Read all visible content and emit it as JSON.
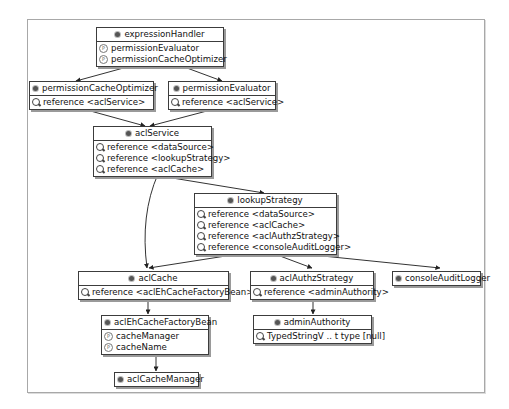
{
  "diagram": {
    "type": "spring-bean-dependency-graph",
    "nodes": {
      "expressionHandler": {
        "title": "expressionHandler",
        "rows": [
          {
            "kind": "property",
            "label": "permissionEvaluator"
          },
          {
            "kind": "property",
            "label": "permissionCacheOptimizer"
          }
        ]
      },
      "permissionCacheOptimizer": {
        "title": "permissionCacheOptimizer",
        "rows": [
          {
            "kind": "reference",
            "label": "reference <aclService>"
          }
        ]
      },
      "permissionEvaluator": {
        "title": "permissionEvaluator",
        "rows": [
          {
            "kind": "reference",
            "label": "reference <aclService>"
          }
        ]
      },
      "aclService": {
        "title": "aclService",
        "rows": [
          {
            "kind": "reference",
            "label": "reference <dataSource>"
          },
          {
            "kind": "reference",
            "label": "reference <lookupStrategy>"
          },
          {
            "kind": "reference",
            "label": "reference <aclCache>"
          }
        ]
      },
      "lookupStrategy": {
        "title": "lookupStrategy",
        "rows": [
          {
            "kind": "reference",
            "label": "reference <dataSource>"
          },
          {
            "kind": "reference",
            "label": "reference <aclCache>"
          },
          {
            "kind": "reference",
            "label": "reference <aclAuthzStrategy>"
          },
          {
            "kind": "reference",
            "label": "reference <consoleAuditLogger>"
          }
        ]
      },
      "aclCache": {
        "title": "aclCache",
        "rows": [
          {
            "kind": "reference",
            "label": "reference <aclEhCacheFactoryBean>"
          }
        ]
      },
      "aclAuthzStrategy": {
        "title": "aclAuthzStrategy",
        "rows": [
          {
            "kind": "reference",
            "label": "reference <adminAuthority>"
          }
        ]
      },
      "consoleAuditLogger": {
        "title": "consoleAuditLogger",
        "rows": []
      },
      "aclEhCacheFactoryBean": {
        "title": "aclEhCacheFactoryBean",
        "rows": [
          {
            "kind": "property",
            "label": "cacheManager"
          },
          {
            "kind": "property",
            "label": "cacheName"
          }
        ]
      },
      "adminAuthority": {
        "title": "adminAuthority",
        "rows": [
          {
            "kind": "reference",
            "label": "TypedStringV .. t type [null]"
          }
        ]
      },
      "aclCacheManager": {
        "title": "aclCacheManager",
        "rows": []
      }
    },
    "edges": [
      {
        "from": "expressionHandler",
        "to": "permissionCacheOptimizer"
      },
      {
        "from": "expressionHandler",
        "to": "permissionEvaluator"
      },
      {
        "from": "permissionCacheOptimizer",
        "to": "aclService"
      },
      {
        "from": "permissionEvaluator",
        "to": "aclService"
      },
      {
        "from": "aclService",
        "to": "lookupStrategy"
      },
      {
        "from": "aclService",
        "to": "aclCache"
      },
      {
        "from": "lookupStrategy",
        "to": "aclCache"
      },
      {
        "from": "lookupStrategy",
        "to": "aclAuthzStrategy"
      },
      {
        "from": "lookupStrategy",
        "to": "consoleAuditLogger"
      },
      {
        "from": "aclCache",
        "to": "aclEhCacheFactoryBean"
      },
      {
        "from": "aclAuthzStrategy",
        "to": "adminAuthority"
      },
      {
        "from": "aclEhCacheFactoryBean",
        "to": "aclCacheManager"
      }
    ]
  },
  "colors": {
    "border": "#3c3c3c",
    "shadow": "#9a9a9a",
    "edge": "#333333",
    "frame": "#a8a8a8"
  }
}
